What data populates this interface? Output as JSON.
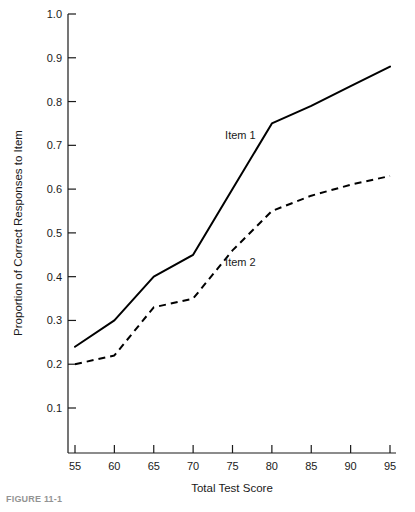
{
  "chart_data": {
    "type": "line",
    "title": "",
    "xlabel": "Total Test Score",
    "ylabel": "Proportion of Correct Responses to Item",
    "x": [
      55,
      60,
      65,
      70,
      75,
      80,
      85,
      90,
      95
    ],
    "xlim": [
      53,
      96
    ],
    "ylim": [
      0.0,
      1.0
    ],
    "xticks": [
      55,
      60,
      65,
      70,
      75,
      80,
      85,
      90,
      95
    ],
    "xtick_labels": [
      "55",
      "60",
      "65",
      "70",
      "75",
      "80",
      "85",
      "90",
      "95"
    ],
    "yticks": [
      0.1,
      0.2,
      0.3,
      0.4,
      0.5,
      0.6,
      0.7,
      0.8,
      0.9,
      1.0
    ],
    "ytick_labels": [
      "0.1",
      "0.2",
      "0.3",
      "0.4",
      "0.5",
      "0.6",
      "0.7",
      "0.8",
      "0.9",
      "1.0"
    ],
    "grid": false,
    "legend_position": "inline-annotation",
    "series": [
      {
        "name": "Item 1",
        "style": "solid",
        "color": "#000000",
        "values": [
          0.24,
          0.3,
          0.4,
          0.45,
          0.6,
          0.75,
          0.79,
          0.835,
          0.88
        ]
      },
      {
        "name": "Item 2",
        "style": "dashed",
        "color": "#000000",
        "values": [
          0.2,
          0.22,
          0.33,
          0.35,
          0.46,
          0.55,
          0.585,
          0.61,
          0.63
        ]
      }
    ],
    "annotations": [
      {
        "text": "Item 1",
        "x": 76.0,
        "y": 0.715
      },
      {
        "text": "Item 2",
        "x": 76.0,
        "y": 0.425
      }
    ]
  },
  "caption": {
    "text": "FIGURE 11-1"
  }
}
